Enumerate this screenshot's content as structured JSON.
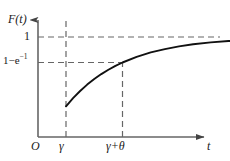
{
  "figure": {
    "axes": {
      "y_label": "F(t)",
      "y_label_function": "F",
      "y_label_arg": "(t)",
      "x_label": "t",
      "origin_label": "O"
    },
    "y_ticks": [
      {
        "label": "1",
        "value": 1
      },
      {
        "label": "1−e",
        "exponent": "−1",
        "value": 0.632
      }
    ],
    "x_ticks": [
      {
        "label": "γ"
      },
      {
        "label": "γ+θ"
      }
    ],
    "colors": {
      "curve": "#111111",
      "axis": "#555555",
      "dashed": "#666666",
      "text": "#1a1a1a",
      "background": "#ffffff"
    }
  },
  "chart_data": {
    "type": "line",
    "title": "",
    "xlabel": "t",
    "ylabel": "F(t)",
    "xlim": [
      0,
      1.9
    ],
    "ylim": [
      0,
      1.12
    ],
    "grid": false,
    "legend": null,
    "annotations": [
      {
        "text": "1",
        "axis": "y",
        "value": 1.0,
        "style": "dashed-line"
      },
      {
        "text": "1−e⁻¹",
        "axis": "y",
        "value": 0.632,
        "style": "dashed-line"
      },
      {
        "text": "γ",
        "axis": "x",
        "value": 0.28,
        "style": "dashed-line"
      },
      {
        "text": "γ+θ",
        "axis": "x",
        "value": 0.6,
        "style": "dashed-line"
      }
    ],
    "series": [
      {
        "name": "F(t) = 1 − e^{-(t-γ)/θ}",
        "x": [
          0.28,
          0.32,
          0.36,
          0.4,
          0.44,
          0.48,
          0.52,
          0.56,
          0.6,
          0.68,
          0.76,
          0.84,
          0.92,
          1.0,
          1.1,
          1.2,
          1.3,
          1.4,
          1.5,
          1.6,
          1.7
        ],
        "y": [
          0.0,
          0.118,
          0.221,
          0.313,
          0.393,
          0.465,
          0.528,
          0.584,
          0.632,
          0.714,
          0.777,
          0.826,
          0.864,
          0.895,
          0.923,
          0.942,
          0.957,
          0.967,
          0.976,
          0.982,
          0.986
        ]
      }
    ]
  }
}
